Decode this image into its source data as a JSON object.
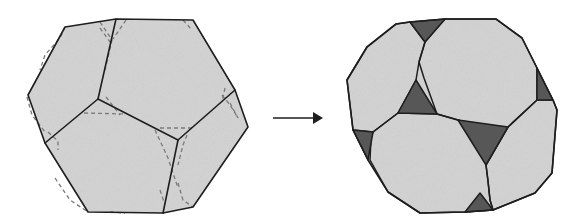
{
  "figure": {
    "colors": {
      "face_fill": "#d6d6d6",
      "truncated_face_fill": "#575757",
      "edge_stroke": "#1e1e1e",
      "guide_stroke": "#7a7a7a",
      "arrow": "#1e1e1e",
      "background": "#ffffff"
    },
    "left_solid": {
      "label": "original-polyhedron",
      "outline": "65,27 116,19 193,20 235,90 248,127 193,207 163,213 88,212 45,143 28,95",
      "edges": [
        "116,19 98,99",
        "98,99 178,140",
        "178,140 235,90",
        "178,140 163,213",
        "98,99 45,143"
      ],
      "guides": [
        "65,27 60,38 45,55 40,70",
        "100,22 112,40 105,70",
        "126,20 113,39",
        "183,20 192,30",
        "100,28 110,42",
        "27,97 32,115 45,132",
        "48,132 58,141 58,150",
        "84,113 125,114",
        "106,97 120,115",
        "160,128 192,128",
        "155,130 168,158 178,188",
        "187,135 183,145 178,165",
        "222,95 230,105 238,118",
        "225,88 222,102",
        "55,178 70,200 88,212",
        "160,190 165,205",
        "178,183 183,200 193,207",
        "110,212 125,213",
        "230,103 238,118"
      ]
    },
    "arrow": {
      "x1": 273,
      "y1": 118,
      "x2": 323,
      "y2": 118
    },
    "right_solid": {
      "label": "truncated-polyhedron",
      "outline": "396,24 410,22 445,19 496,19 522,38 537,68 553,100 557,110 552,173 535,193 493,210 465,212 420,213 388,192 368,160 353,130 347,80 367,47",
      "light_faces": [
        "396,24 410,22 425,42 419,62 416,80 398,113 373,132 353,130 347,80 367,47",
        "445,19 496,19 522,38 537,68 537,100 508,127 482,128 458,120 437,114 424,78 419,62 425,42",
        "373,132 398,113 437,114 458,120 482,128 486,165 488,181 490,200 493,210 465,212 420,213 388,192 370,160 371,138",
        "508,127 537,100 553,100 557,110 552,173 535,193 493,210 490,200 488,181 486,165"
      ],
      "dark_triangles": [
        "410,22 445,19 425,42",
        "416,80 398,113 437,114",
        "537,68 537,100 553,100",
        "458,120 508,127 486,165",
        "353,130 373,132 368,160",
        "465,212 493,210 480,193"
      ]
    }
  }
}
